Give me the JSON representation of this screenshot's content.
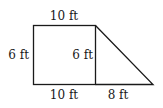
{
  "figure": {
    "type": "composite shape: rectangle + right triangle",
    "labels": {
      "top": "10 ft",
      "left": "6 ft",
      "inner_vertical": "6 ft",
      "bottom_rect": "10 ft",
      "bottom_triangle": "8 ft"
    },
    "stroke_color": "#1a1a1a"
  }
}
